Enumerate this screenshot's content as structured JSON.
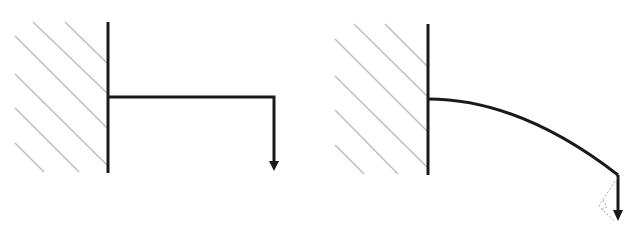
{
  "diagram": {
    "colors": {
      "line": "#1a1a1a",
      "hatch": "#b8b8b8",
      "ghost": "#aaaaaa",
      "background": "#ffffff"
    },
    "panels": [
      {
        "id": "undeformed",
        "description": "Fixed wall with straight horizontal beam and downward end load"
      },
      {
        "id": "deflected",
        "description": "Fixed wall with curved deflected beam, downward end load and dashed rotated-load reference"
      }
    ],
    "icons": {
      "load": "down-arrow"
    }
  }
}
